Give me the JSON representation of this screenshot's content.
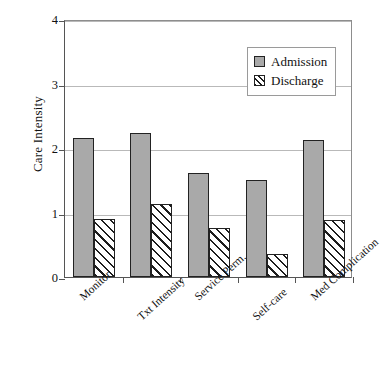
{
  "chart_data": {
    "type": "bar",
    "title": "",
    "xlabel": "",
    "ylabel": "Care Intensity",
    "ylim": [
      0,
      4
    ],
    "yticks": [
      "0",
      "1",
      "2",
      "3",
      "4"
    ],
    "grid": true,
    "legend_position": "top-right-inside",
    "categories": [
      "Monitor",
      "Txt Intensity",
      "Service Perm.",
      "Self-care",
      "Med Complication"
    ],
    "series": [
      {
        "name": "Admission",
        "color": "#a9a9a9",
        "fill": "solid",
        "values": [
          2.15,
          2.23,
          1.62,
          1.51,
          2.12
        ]
      },
      {
        "name": "Discharge",
        "color": "#ffffff",
        "fill": "diagonal-hatch",
        "values": [
          0.9,
          1.13,
          0.76,
          0.35,
          0.88
        ]
      }
    ]
  },
  "legend": {
    "items": [
      {
        "label": "Admission"
      },
      {
        "label": "Discharge"
      }
    ]
  }
}
